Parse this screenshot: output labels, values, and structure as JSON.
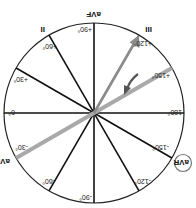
{
  "diagram": {
    "orientation": "rotated 180 degrees",
    "colors": {
      "axis_lines": "#111111",
      "circle": "#222222",
      "highlight_axis": "#a9a9a9",
      "vector_arrow": "#8c8c8c",
      "rotation_arrow": "#555555",
      "avr_ring": "#777777"
    },
    "degree_labels": {
      "d0": "0°",
      "d30p": "+30°",
      "d60p": "+60°",
      "d90p": "+90°",
      "d120p": "+120°",
      "d150p": "+150°",
      "d180": "180°",
      "d150n": "-150°",
      "d120n": "-120°",
      "d90n": "-90°",
      "d60n": "-60°",
      "d30n": "-30°"
    },
    "lead_labels": {
      "avf": "aVF",
      "ii": "II",
      "iii": "III",
      "avl": "aVL",
      "avr": "aVR"
    },
    "axes_degrees": [
      0,
      30,
      60,
      90,
      120,
      150
    ],
    "highlighted_axis_degrees": -30,
    "vector_degrees": 120,
    "circled_lead": "aVR"
  }
}
